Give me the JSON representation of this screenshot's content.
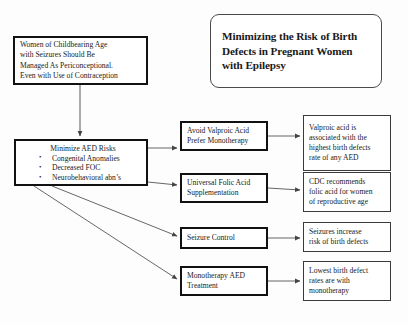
{
  "diagram": {
    "title_box": {
      "name": "diagram-title",
      "lines": [
        "Minimizing the Risk of Birth",
        "Defects in Pregnant Women",
        "with Epilepsy"
      ]
    },
    "intro_box": {
      "lines": [
        "Women of Childbearing Age",
        "with Seizures Should Be",
        "Managed As Periconceptional.",
        "Even with Use of Contraception"
      ]
    },
    "aed_box": {
      "heading": "Minimize AED Risks",
      "bullets": [
        "Congenital Anomalies",
        "Decreased FOC",
        "Neurobehavioral abn’s"
      ]
    },
    "branches": [
      {
        "action_lines": [
          "Avoid Valproic Acid",
          "Prefer Monotherapy"
        ],
        "outcome_lines": [
          "Valproic acid is",
          "associated with the",
          "highest birth defects",
          "rate of any AED"
        ]
      },
      {
        "action_lines": [
          "Universal Folic Acid",
          "Supplementation"
        ],
        "outcome_lines": [
          "CDC recommends",
          "folic acid for women",
          "of reproductive age"
        ]
      },
      {
        "action_lines": [
          "Seizure Control"
        ],
        "outcome_lines": [
          "Seizures increase",
          "risk of birth defects"
        ]
      },
      {
        "action_lines": [
          "Monotherapy AED",
          "Treatment"
        ],
        "outcome_lines": [
          "Lowest birth defect",
          "rates are with",
          "monotherapy"
        ]
      }
    ],
    "colors": {
      "box_border_heavy": "#111111",
      "box_border_thin": "#3a3a3a",
      "connector": "#555555",
      "background": "#fdfdfd",
      "text": "#1a1a1a"
    }
  }
}
